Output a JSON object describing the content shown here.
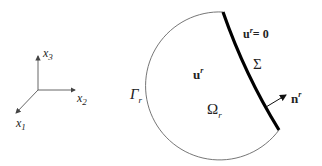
{
  "axes": {
    "x1": {
      "base": "x",
      "sub": "1"
    },
    "x2": {
      "base": "x",
      "sub": "2"
    },
    "x3": {
      "base": "x",
      "sub": "3"
    }
  },
  "domain": {
    "boundary_label": {
      "base": "Γ",
      "sub": "r"
    },
    "region_label": {
      "base": "Ω",
      "sub": "r"
    },
    "field_label": {
      "base": "u",
      "sup": "r"
    },
    "interface_label": "Σ",
    "interface_condition": {
      "base": "u",
      "sup": "r",
      "rest": "= 0"
    },
    "normal_label": {
      "base": "n",
      "sup": "r"
    }
  }
}
